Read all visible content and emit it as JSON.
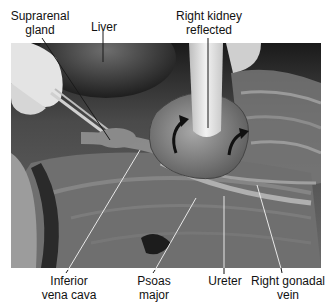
{
  "figure": {
    "type": "labeled anatomical dissection photograph (grayscale)"
  },
  "labels": {
    "suprarenal_gland": [
      "Suprarenal",
      "gland"
    ],
    "liver": [
      "Liver"
    ],
    "right_kidney_reflected": [
      "Right kidney",
      "reflected"
    ],
    "inferior_vena_cava": [
      "Inferior",
      "vena cava"
    ],
    "psoas_major": [
      "Psoas",
      "major"
    ],
    "ureter": [
      "Ureter"
    ],
    "right_gonadal_vein": [
      "Right gonadal",
      "vein"
    ]
  },
  "colors": {
    "background": "#ffffff",
    "label_text": "#111111",
    "leader_line": "#1a1a1a",
    "leader_line_light": "#e8e8e8"
  }
}
